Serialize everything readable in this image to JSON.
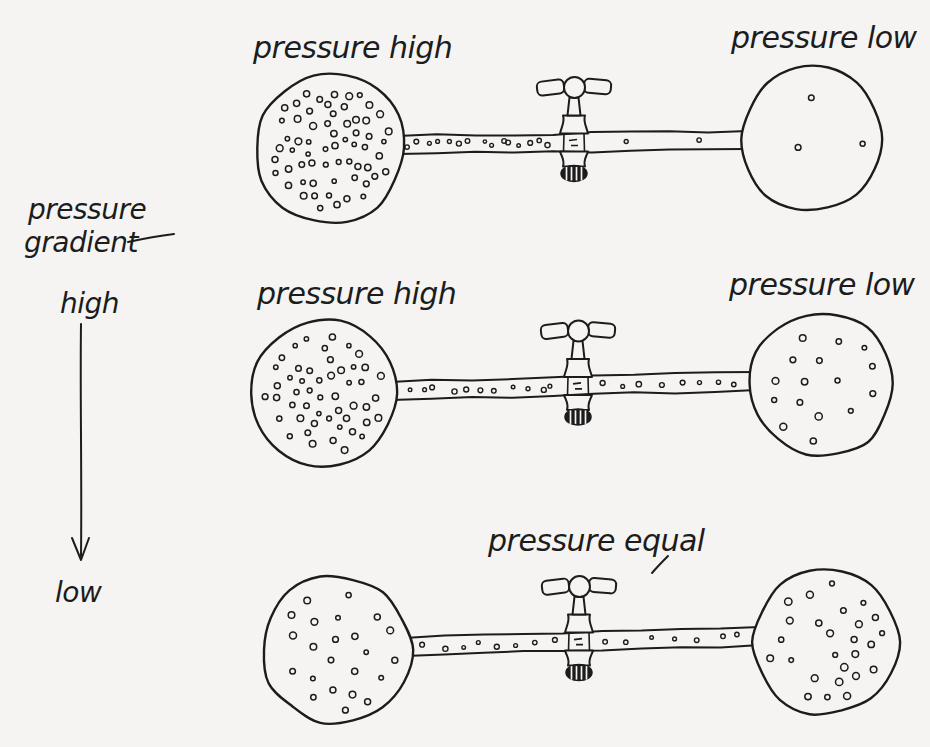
{
  "figure": {
    "title": "pressure gradient"
  },
  "palette": {
    "ink": "#1c1c1c",
    "paper": "#f5f4f2"
  },
  "legend": {
    "title_line1": "pressure",
    "title_line2": "gradient",
    "high_label": "high",
    "low_label": "low",
    "arrow_direction": "down"
  },
  "stages": [
    {
      "id": "stage-1",
      "left_label": "pressure high",
      "right_label": "pressure low",
      "left_bulb_dots": 62,
      "right_bulb_dots": 3,
      "tube_dots_left": 15,
      "tube_dots_right": 2
    },
    {
      "id": "stage-2",
      "left_label": "pressure high",
      "right_label": "pressure low",
      "left_bulb_dots": 50,
      "right_bulb_dots": 16,
      "tube_dots_left": 11,
      "tube_dots_right": 8
    },
    {
      "id": "stage-3",
      "center_label": "pressure equal",
      "left_bulb_dots": 23,
      "right_bulb_dots": 26,
      "tube_dots_left": 8,
      "tube_dots_right": 7
    }
  ]
}
